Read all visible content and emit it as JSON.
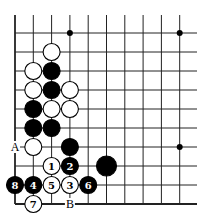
{
  "board": {
    "columns": 10,
    "rows": 10,
    "open_top": true,
    "open_right": true,
    "left_edge": true,
    "bottom_edge": true,
    "line_color": "#222222",
    "black_color": "#000000",
    "white_color": "#ffffff",
    "star_points": [
      [
        4,
        1
      ],
      [
        10,
        1
      ],
      [
        10,
        7
      ]
    ],
    "stones": [
      {
        "col": 3,
        "row": 2,
        "color": "white",
        "label": ""
      },
      {
        "col": 2,
        "row": 3,
        "color": "white",
        "label": ""
      },
      {
        "col": 3,
        "row": 3,
        "color": "black",
        "label": ""
      },
      {
        "col": 2,
        "row": 4,
        "color": "white",
        "label": ""
      },
      {
        "col": 3,
        "row": 4,
        "color": "black",
        "label": ""
      },
      {
        "col": 4,
        "row": 4,
        "color": "white",
        "label": ""
      },
      {
        "col": 2,
        "row": 5,
        "color": "black",
        "label": ""
      },
      {
        "col": 3,
        "row": 5,
        "color": "white",
        "label": ""
      },
      {
        "col": 4,
        "row": 5,
        "color": "white",
        "label": ""
      },
      {
        "col": 2,
        "row": 6,
        "color": "black",
        "label": ""
      },
      {
        "col": 3,
        "row": 6,
        "color": "black",
        "label": ""
      },
      {
        "col": 2,
        "row": 7,
        "color": "white",
        "label": ""
      },
      {
        "col": 4,
        "row": 7,
        "color": "black",
        "label": ""
      },
      {
        "col": 3,
        "row": 8,
        "color": "white",
        "label": "1"
      },
      {
        "col": 4,
        "row": 8,
        "color": "black",
        "label": "2"
      },
      {
        "col": 6,
        "row": 8,
        "color": "black",
        "label": ""
      },
      {
        "col": 4,
        "row": 9,
        "color": "white",
        "label": "3"
      },
      {
        "col": 2,
        "row": 9,
        "color": "black",
        "label": "4"
      },
      {
        "col": 3,
        "row": 9,
        "color": "white",
        "label": "5"
      },
      {
        "col": 5,
        "row": 9,
        "color": "black",
        "label": "6"
      },
      {
        "col": 2,
        "row": 10,
        "color": "white",
        "label": "7"
      },
      {
        "col": 1,
        "row": 9,
        "color": "black",
        "label": "8"
      }
    ],
    "point_labels": [
      {
        "col": 1,
        "row": 7,
        "text": "A"
      },
      {
        "col": 4,
        "row": 10,
        "text": "B"
      }
    ]
  }
}
